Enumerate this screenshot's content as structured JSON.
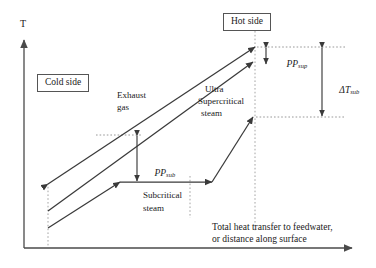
{
  "figure": {
    "type": "line-diagram"
  },
  "axes": {
    "y_label": "T",
    "x_caption_line1": "Total heat transfer to feedwater,",
    "x_caption_line2": "or distance along surface"
  },
  "boxes": {
    "cold_side": "Cold side",
    "hot_side": "Hot side"
  },
  "curves": {
    "exhaust_gas_line1": "Exhaust",
    "exhaust_gas_line2": "gas",
    "ultra_supercritical_line1": "Ultra",
    "ultra_supercritical_line2": "Supercritical",
    "ultra_supercritical_line3": "steam",
    "subcritical_line1": "Subcritical",
    "subcritical_line2": "steam"
  },
  "annotations": {
    "pp_sup_symbol": "PP",
    "pp_sup_subscript": "sup",
    "pp_sub_symbol": "PP",
    "pp_sub_subscript": "sub",
    "delta_t_symbol": "ΔT",
    "delta_t_subscript": "sub"
  },
  "colors": {
    "line": "#3a3a3a",
    "dashed": "#8c8c8c",
    "axis": "#4a4a4a",
    "text": "#1a1a1a",
    "box_border": "#555555",
    "background": "#ffffff"
  }
}
